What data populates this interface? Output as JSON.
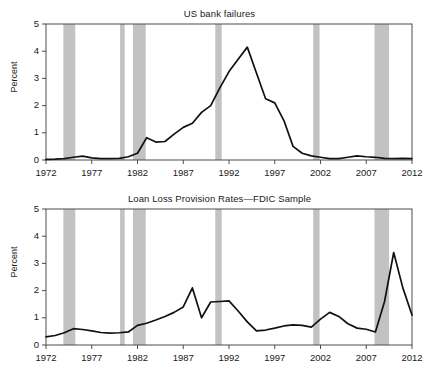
{
  "figure": {
    "width": 439,
    "height": 371,
    "background": "#ffffff",
    "band_color": "#c2c2c2",
    "line_color": "#111111",
    "axis_color": "#4d4d4d"
  },
  "panels": [
    {
      "id": "us-bank-failures",
      "title": "US bank failures",
      "ylabel": "Percent"
    },
    {
      "id": "loan-loss-provision-rates",
      "title": "Loan Loss Provision Rates—FDIC Sample",
      "ylabel": "Percent"
    }
  ],
  "chart_data": [
    {
      "type": "line",
      "title": "US bank failures",
      "xlabel": "",
      "ylabel": "Percent",
      "xlim": [
        1972,
        2012
      ],
      "ylim": [
        0,
        5
      ],
      "xticks": [
        1972,
        1977,
        1982,
        1987,
        1992,
        1997,
        2002,
        2007,
        2012
      ],
      "yticks": [
        0,
        1,
        2,
        3,
        4,
        5
      ],
      "xtick_labels": [
        "1972",
        "1977",
        "1982",
        "1987",
        "1992",
        "1997",
        "2002",
        "2007",
        "2012"
      ],
      "ytick_labels": [
        "0",
        "1",
        "2",
        "3",
        "4",
        "5"
      ],
      "grid": false,
      "legend": null,
      "shaded_regions": [
        {
          "label": "recession",
          "start": 1973.9,
          "end": 1975.2
        },
        {
          "label": "recession",
          "start": 1980.1,
          "end": 1980.6
        },
        {
          "label": "recession",
          "start": 1981.5,
          "end": 1982.9
        },
        {
          "label": "recession",
          "start": 1990.5,
          "end": 1991.2
        },
        {
          "label": "recession",
          "start": 2001.2,
          "end": 2001.9
        },
        {
          "label": "recession",
          "start": 2007.9,
          "end": 2009.5
        }
      ],
      "x": [
        1972,
        1973,
        1974,
        1975,
        1976,
        1977,
        1978,
        1979,
        1980,
        1981,
        1982,
        1983,
        1984,
        1985,
        1986,
        1987,
        1988,
        1989,
        1990,
        1991,
        1992,
        1993,
        1994,
        1995,
        1996,
        1997,
        1998,
        1999,
        2000,
        2001,
        2002,
        2003,
        2004,
        2005,
        2006,
        2007,
        2008,
        2009,
        2010,
        2011,
        2012
      ],
      "values": [
        0.02,
        0.03,
        0.05,
        0.1,
        0.14,
        0.08,
        0.05,
        0.05,
        0.06,
        0.12,
        0.25,
        0.82,
        0.66,
        0.68,
        0.95,
        1.2,
        1.35,
        1.75,
        2.0,
        2.65,
        3.25,
        3.7,
        4.15,
        3.2,
        2.25,
        2.1,
        1.45,
        0.5,
        0.25,
        0.15,
        0.1,
        0.05,
        0.05,
        0.1,
        0.15,
        0.12,
        0.1,
        0.06,
        0.05,
        0.06,
        0.05
      ]
    },
    {
      "type": "line",
      "title": "Loan Loss Provision Rates—FDIC Sample",
      "xlabel": "",
      "ylabel": "Percent",
      "xlim": [
        1972,
        2012
      ],
      "ylim": [
        0,
        5
      ],
      "xticks": [
        1972,
        1977,
        1982,
        1987,
        1992,
        1997,
        2002,
        2007,
        2012
      ],
      "yticks": [
        0,
        1,
        2,
        3,
        4,
        5
      ],
      "xtick_labels": [
        "1972",
        "1977",
        "1982",
        "1987",
        "1992",
        "1997",
        "2002",
        "2007",
        "2012"
      ],
      "ytick_labels": [
        "0",
        "1",
        "2",
        "3",
        "4",
        "5"
      ],
      "grid": false,
      "legend": null,
      "shaded_regions": [
        {
          "label": "recession",
          "start": 1973.9,
          "end": 1975.2
        },
        {
          "label": "recession",
          "start": 1980.1,
          "end": 1980.6
        },
        {
          "label": "recession",
          "start": 1981.5,
          "end": 1982.9
        },
        {
          "label": "recession",
          "start": 1990.5,
          "end": 1991.2
        },
        {
          "label": "recession",
          "start": 2001.2,
          "end": 2001.9
        },
        {
          "label": "recession",
          "start": 2007.9,
          "end": 2009.5
        }
      ],
      "x": [
        1972,
        1973,
        1974,
        1975,
        1976,
        1977,
        1978,
        1979,
        1980,
        1981,
        1982,
        1983,
        1984,
        1985,
        1986,
        1987,
        1988,
        1989,
        1990,
        1991,
        1992,
        1993,
        1994,
        1995,
        1996,
        1997,
        1998,
        1999,
        2000,
        2001,
        2002,
        2003,
        2004,
        2005,
        2006,
        2007,
        2008,
        2009,
        2010,
        2011,
        2012
      ],
      "values": [
        0.3,
        0.35,
        0.45,
        0.6,
        0.57,
        0.52,
        0.46,
        0.44,
        0.45,
        0.48,
        0.72,
        0.8,
        0.92,
        1.05,
        1.2,
        1.4,
        2.1,
        1.0,
        1.58,
        1.6,
        1.62,
        1.25,
        0.85,
        0.52,
        0.55,
        0.62,
        0.7,
        0.74,
        0.72,
        0.66,
        0.95,
        1.2,
        1.05,
        0.78,
        0.62,
        0.58,
        0.48,
        1.6,
        3.4,
        2.1,
        1.1,
        0.78
      ]
    }
  ]
}
